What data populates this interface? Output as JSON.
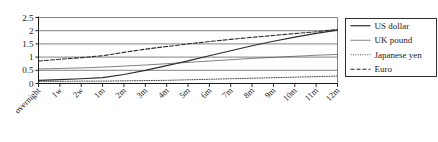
{
  "chart_data": {
    "type": "line",
    "title": "",
    "subtitle": "",
    "xlabel": "",
    "ylabel": "",
    "grid": true,
    "legend_position": "right",
    "ylim": [
      0,
      2.5
    ],
    "yticks": [
      "0",
      "0.5",
      "1",
      "1.5",
      "2",
      "2.5"
    ],
    "ytick_values": [
      0,
      0.5,
      1,
      1.5,
      2,
      2.5
    ],
    "categories": [
      "overnight",
      "1w",
      "2w",
      "1m",
      "2m",
      "3m",
      "4m",
      "5m",
      "6m",
      "7m",
      "8m",
      "9m",
      "10m",
      "11m",
      "12m"
    ],
    "series": [
      {
        "name": "US dollar",
        "style": "solid",
        "width": 1.2,
        "color": "#2b2b2b",
        "values": [
          0.12,
          0.15,
          0.18,
          0.22,
          0.34,
          0.5,
          0.68,
          0.86,
          1.05,
          1.24,
          1.43,
          1.6,
          1.76,
          1.9,
          2.02
        ]
      },
      {
        "name": "UK pound",
        "style": "solid",
        "width": 0.7,
        "color": "#4a4a4a",
        "values": [
          0.55,
          0.57,
          0.59,
          0.62,
          0.66,
          0.7,
          0.75,
          0.8,
          0.85,
          0.9,
          0.95,
          0.99,
          1.03,
          1.07,
          1.1
        ]
      },
      {
        "name": "Japanese yen",
        "style": "dotted",
        "width": 0.9,
        "color": "#3a3a3a",
        "values": [
          0.08,
          0.08,
          0.09,
          0.09,
          0.1,
          0.11,
          0.12,
          0.14,
          0.16,
          0.18,
          0.2,
          0.22,
          0.24,
          0.26,
          0.28
        ]
      },
      {
        "name": "Euro",
        "style": "dashed",
        "width": 1.1,
        "color": "#2b2b2b",
        "values": [
          0.85,
          0.92,
          0.98,
          1.05,
          1.18,
          1.3,
          1.4,
          1.5,
          1.59,
          1.67,
          1.75,
          1.82,
          1.89,
          1.96,
          2.05
        ]
      }
    ]
  },
  "legend": {
    "items": [
      {
        "label": "US dollar"
      },
      {
        "label": "UK pound"
      },
      {
        "label": "Japanese yen"
      },
      {
        "label": "Euro"
      }
    ]
  },
  "colors": {
    "axis": "#1a1a1a",
    "grid": "#4d4d4d",
    "text": "#1a1a1a",
    "background": "#ffffff",
    "legend_border": "#1a1a1a"
  }
}
